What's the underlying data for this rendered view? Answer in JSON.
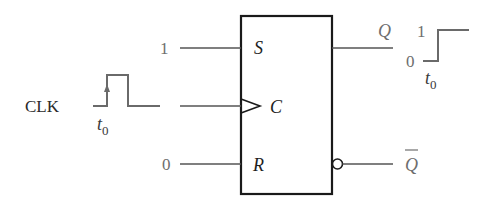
{
  "diagram": {
    "type": "SR flip-flop timing illustration",
    "flip_flop": {
      "inputs": [
        {
          "pin": "S",
          "value": "1"
        },
        {
          "pin": "C",
          "value": "CLK"
        },
        {
          "pin": "R",
          "value": "0"
        }
      ],
      "outputs": [
        {
          "pin": "Q"
        },
        {
          "pin": "Q̄"
        }
      ]
    },
    "labels": {
      "s_pin": "S",
      "c_pin": "C",
      "r_pin": "R",
      "s_input_value": "1",
      "r_input_value": "0",
      "clk_label": "CLK",
      "clk_time": "t",
      "clk_time_sub": "0",
      "q_label": "Q",
      "qbar_label": "Q",
      "q_wave_high": "1",
      "q_wave_low": "0",
      "q_wave_time": "t",
      "q_wave_time_sub": "0"
    },
    "colors": {
      "box_stroke": "#1a1a1a",
      "wire": "#555555",
      "wave": "#6a6a6a",
      "label_gray": "#6e6e6e"
    }
  }
}
